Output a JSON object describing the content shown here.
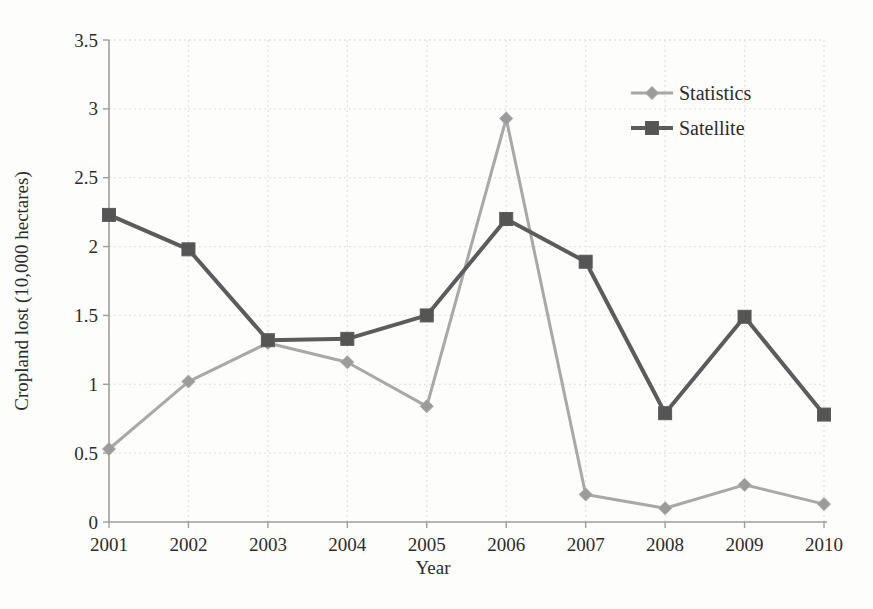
{
  "chart_data": {
    "type": "line",
    "title": "",
    "xlabel": "Year",
    "ylabel": "Cropland lost (10,000 hectares)",
    "x": [
      2001,
      2002,
      2003,
      2004,
      2005,
      2006,
      2007,
      2008,
      2009,
      2010
    ],
    "series": [
      {
        "name": "Statistics",
        "marker": "diamond",
        "line_color": "#a8a8a8",
        "marker_color": "#9b9b9b",
        "line_width": 3,
        "values": [
          0.53,
          1.02,
          1.3,
          1.16,
          0.84,
          2.93,
          0.2,
          0.1,
          0.27,
          0.13
        ]
      },
      {
        "name": "Satellite",
        "marker": "square",
        "line_color": "#5c5c5c",
        "marker_color": "#555555",
        "line_width": 4,
        "values": [
          2.23,
          1.98,
          1.32,
          1.33,
          1.5,
          2.2,
          1.89,
          0.79,
          1.49,
          0.78
        ]
      }
    ],
    "ylim": [
      0,
      3.5
    ],
    "ytick_step": 0.5,
    "yticks": [
      "0",
      "0.5",
      "1",
      "1.5",
      "2",
      "2.5",
      "3",
      "3.5"
    ],
    "grid": true,
    "gridline_style": "dotted",
    "legend_position": "upper right",
    "legend": [
      "Statistics",
      "Satellite"
    ]
  },
  "colors": {
    "background": "#fdfdfb",
    "axis": "#9e9e9e",
    "gridline": "#e4e4e2",
    "text": "#2e2c2a"
  }
}
